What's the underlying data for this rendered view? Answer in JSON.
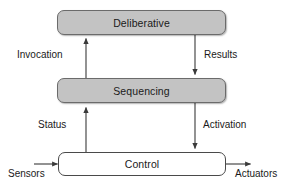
{
  "diagram": {
    "colors": {
      "box_shaded_fill": "#c3c3c3",
      "box_plain_fill": "#ffffff",
      "box_stroke": "#6b6b6b",
      "arrow": "#3a3a3a",
      "text": "#1a1a1a",
      "background": "#ffffff"
    },
    "boxes": [
      {
        "id": "deliberative",
        "label": "Deliberative",
        "style": "shaded"
      },
      {
        "id": "sequencing",
        "label": "Sequencing",
        "style": "shaded"
      },
      {
        "id": "control",
        "label": "Control",
        "style": "plain"
      }
    ],
    "edges": [
      {
        "id": "invocation",
        "label": "Invocation",
        "from": "sequencing",
        "to": "deliberative",
        "direction": "up"
      },
      {
        "id": "results",
        "label": "Results",
        "from": "deliberative",
        "to": "sequencing",
        "direction": "down"
      },
      {
        "id": "status",
        "label": "Status",
        "from": "control",
        "to": "sequencing",
        "direction": "up"
      },
      {
        "id": "activation",
        "label": "Activation",
        "from": "sequencing",
        "to": "control",
        "direction": "down"
      }
    ],
    "io": [
      {
        "id": "sensors",
        "label": "Sensors",
        "direction": "in",
        "side": "left"
      },
      {
        "id": "actuators",
        "label": "Actuators",
        "direction": "out",
        "side": "right"
      }
    ]
  }
}
